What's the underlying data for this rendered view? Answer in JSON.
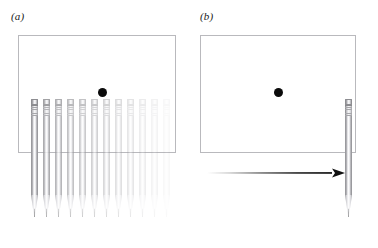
{
  "figure": {
    "width": 378,
    "height": 248,
    "background": "#ffffff",
    "stroke_color": "#b9b9bd",
    "dot_color": "#0b0b0b",
    "arrow_color": "#111111"
  },
  "panels": [
    {
      "id": "a",
      "label": "(a)",
      "caption_note": "multiple overlaid pencil positions fading left to right",
      "box": {
        "x": 18,
        "y": 35,
        "w": 158,
        "h": 118
      },
      "dot": {
        "x": 102,
        "y": 92,
        "d": 9
      },
      "pencils": [
        {
          "x": 31,
          "top": 99,
          "len": 118,
          "opacity": 1.0
        },
        {
          "x": 43,
          "top": 99,
          "len": 118,
          "opacity": 0.82
        },
        {
          "x": 55,
          "top": 99,
          "len": 118,
          "opacity": 0.7
        },
        {
          "x": 67,
          "top": 99,
          "len": 118,
          "opacity": 0.6
        },
        {
          "x": 79,
          "top": 99,
          "len": 118,
          "opacity": 0.52
        },
        {
          "x": 91,
          "top": 99,
          "len": 118,
          "opacity": 0.45
        },
        {
          "x": 103,
          "top": 99,
          "len": 118,
          "opacity": 0.38
        },
        {
          "x": 115,
          "top": 99,
          "len": 118,
          "opacity": 0.3
        },
        {
          "x": 127,
          "top": 99,
          "len": 118,
          "opacity": 0.24
        },
        {
          "x": 139,
          "top": 99,
          "len": 118,
          "opacity": 0.17
        },
        {
          "x": 151,
          "top": 99,
          "len": 118,
          "opacity": 0.11
        },
        {
          "x": 163,
          "top": 99,
          "len": 118,
          "opacity": 0.06
        }
      ],
      "arrow": null
    },
    {
      "id": "b",
      "label": "(b)",
      "caption_note": "single pencil at rest with motion arrow pointing right",
      "box": {
        "x": 200,
        "y": 35,
        "w": 156,
        "h": 118
      },
      "dot": {
        "x": 278,
        "y": 92,
        "d": 9
      },
      "pencils": [
        {
          "x": 345,
          "top": 99,
          "len": 118,
          "opacity": 1.0
        }
      ],
      "arrow": {
        "x1": 207,
        "x2": 345,
        "y": 173,
        "head_len": 13,
        "head_w": 9,
        "gradient": "fades in from transparent at left to solid at right"
      }
    }
  ]
}
